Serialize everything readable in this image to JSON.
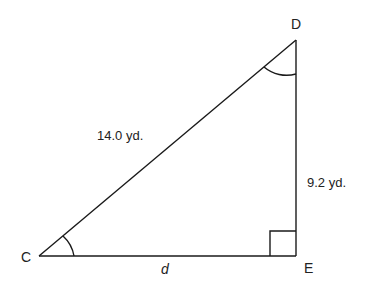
{
  "diagram": {
    "type": "right-triangle",
    "vertices": [
      {
        "name": "C",
        "x": 39,
        "y": 256
      },
      {
        "name": "D",
        "x": 296,
        "y": 40
      },
      {
        "name": "E",
        "x": 296,
        "y": 256
      }
    ],
    "labels": {
      "C": "C",
      "D": "D",
      "E": "E",
      "hypotenuse": "14.0 yd.",
      "vertical_side": "9.2 yd.",
      "horizontal_side": "d"
    },
    "right_angle_at": "E",
    "marked_angles": [
      "C",
      "D"
    ],
    "stroke_color": "#1a1a1a"
  }
}
